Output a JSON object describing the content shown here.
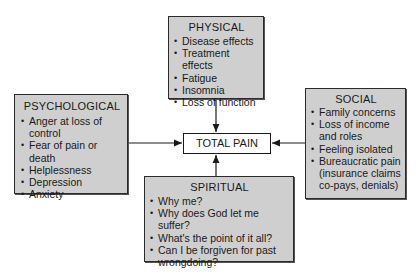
{
  "diagram": {
    "center": {
      "label": "TOTAL PAIN"
    },
    "physical": {
      "title": "PHYSICAL",
      "items": [
        "Disease effects",
        "Treatment effects",
        "Fatigue",
        "Insomnia",
        "Loss of function"
      ]
    },
    "psychological": {
      "title": "PSYCHOLOGICAL",
      "items": [
        "Anger at loss of control",
        "Fear of pain or death",
        "Helplessness",
        "Depression",
        "Anxiety"
      ]
    },
    "social": {
      "title": "SOCIAL",
      "items": [
        "Family concerns",
        "Loss of income and roles",
        "Feeling isolated",
        "Bureaucratic pain (insurance claims co-pays, denials)"
      ]
    },
    "spiritual": {
      "title": "SPIRITUAL",
      "items": [
        "Why me?",
        "Why does God let me suffer?",
        "What's the point of it all?",
        "Can I be forgiven for past wrongdoing?"
      ]
    },
    "colors": {
      "box_fill": "#cfcfcf",
      "border": "#2a2a2a",
      "background": "#ffffff"
    }
  }
}
